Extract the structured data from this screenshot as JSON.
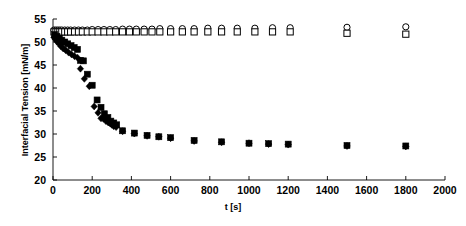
{
  "chart_data": {
    "type": "scatter",
    "title": "",
    "xlabel": "t [s]",
    "ylabel": "Interfacial Tension [mN/m]",
    "xlim": [
      0,
      2000
    ],
    "ylim": [
      20,
      55
    ],
    "xticks": [
      0,
      200,
      400,
      600,
      800,
      1000,
      1200,
      1400,
      1600,
      1800,
      2000
    ],
    "yticks": [
      20,
      25,
      30,
      35,
      40,
      45,
      50,
      55
    ],
    "grid": false,
    "legend": "none",
    "axis_color": "#000000",
    "marker_color": "#000000",
    "series": [
      {
        "name": "open-circle-series",
        "marker": "open-circle",
        "points": [
          [
            5,
            52.6
          ],
          [
            15,
            52.6
          ],
          [
            25,
            52.6
          ],
          [
            35,
            52.6
          ],
          [
            45,
            52.6
          ],
          [
            60,
            52.6
          ],
          [
            75,
            52.6
          ],
          [
            90,
            52.6
          ],
          [
            110,
            52.6
          ],
          [
            130,
            52.6
          ],
          [
            150,
            52.6
          ],
          [
            175,
            52.6
          ],
          [
            200,
            52.7
          ],
          [
            230,
            52.7
          ],
          [
            260,
            52.7
          ],
          [
            290,
            52.7
          ],
          [
            320,
            52.7
          ],
          [
            355,
            52.8
          ],
          [
            390,
            52.8
          ],
          [
            425,
            52.8
          ],
          [
            465,
            52.8
          ],
          [
            505,
            52.8
          ],
          [
            545,
            52.9
          ],
          [
            600,
            52.9
          ],
          [
            660,
            52.9
          ],
          [
            720,
            52.9
          ],
          [
            790,
            53.0
          ],
          [
            860,
            53.0
          ],
          [
            940,
            53.0
          ],
          [
            1030,
            53.0
          ],
          [
            1120,
            53.1
          ],
          [
            1210,
            53.1
          ],
          [
            1500,
            53.2
          ],
          [
            1800,
            53.3
          ]
        ]
      },
      {
        "name": "open-square-series",
        "marker": "open-square",
        "points": [
          [
            5,
            52.2
          ],
          [
            15,
            52.2
          ],
          [
            25,
            52.2
          ],
          [
            35,
            52.2
          ],
          [
            45,
            52.2
          ],
          [
            60,
            52.2
          ],
          [
            75,
            52.2
          ],
          [
            90,
            52.2
          ],
          [
            110,
            52.2
          ],
          [
            130,
            52.2
          ],
          [
            150,
            52.2
          ],
          [
            175,
            52.2
          ],
          [
            200,
            52.2
          ],
          [
            230,
            52.2
          ],
          [
            260,
            52.2
          ],
          [
            290,
            52.2
          ],
          [
            320,
            52.2
          ],
          [
            355,
            52.2
          ],
          [
            390,
            52.2
          ],
          [
            425,
            52.2
          ],
          [
            465,
            52.2
          ],
          [
            505,
            52.2
          ],
          [
            545,
            52.2
          ],
          [
            600,
            52.2
          ],
          [
            660,
            52.2
          ],
          [
            720,
            52.2
          ],
          [
            790,
            52.2
          ],
          [
            860,
            52.2
          ],
          [
            940,
            52.2
          ],
          [
            1030,
            52.2
          ],
          [
            1120,
            52.2
          ],
          [
            1210,
            52.2
          ],
          [
            1500,
            51.9
          ],
          [
            1800,
            51.7
          ]
        ]
      },
      {
        "name": "filled-diamond-series",
        "marker": "filled-diamond",
        "points": [
          [
            5,
            51.0
          ],
          [
            12,
            50.6
          ],
          [
            20,
            50.1
          ],
          [
            30,
            49.6
          ],
          [
            40,
            49.1
          ],
          [
            52,
            48.6
          ],
          [
            65,
            48.2
          ],
          [
            80,
            47.7
          ],
          [
            95,
            47.3
          ],
          [
            110,
            46.9
          ],
          [
            125,
            46.6
          ],
          [
            140,
            44.2
          ],
          [
            160,
            42.0
          ],
          [
            185,
            40.4
          ],
          [
            210,
            36.0
          ],
          [
            230,
            34.6
          ],
          [
            245,
            33.4
          ],
          [
            258,
            33.3
          ],
          [
            270,
            32.8
          ],
          [
            282,
            32.5
          ],
          [
            292,
            32.3
          ],
          [
            300,
            32.0
          ],
          [
            310,
            31.7
          ],
          [
            322,
            31.5
          ],
          [
            355,
            30.6
          ],
          [
            415,
            30.1
          ],
          [
            480,
            29.6
          ],
          [
            540,
            29.4
          ],
          [
            600,
            29.1
          ],
          [
            720,
            28.5
          ],
          [
            860,
            28.2
          ],
          [
            1000,
            28.0
          ],
          [
            1100,
            27.8
          ],
          [
            1200,
            27.7
          ],
          [
            1500,
            27.4
          ],
          [
            1800,
            27.3
          ]
        ]
      },
      {
        "name": "filled-square-series",
        "marker": "filled-square",
        "points": [
          [
            8,
            51.6
          ],
          [
            20,
            51.2
          ],
          [
            32,
            50.8
          ],
          [
            45,
            50.4
          ],
          [
            60,
            50.0
          ],
          [
            75,
            49.6
          ],
          [
            92,
            49.2
          ],
          [
            108,
            48.8
          ],
          [
            125,
            48.4
          ],
          [
            140,
            46.0
          ],
          [
            155,
            45.9
          ],
          [
            175,
            43.0
          ],
          [
            200,
            40.6
          ],
          [
            225,
            37.4
          ],
          [
            245,
            35.8
          ],
          [
            262,
            34.4
          ],
          [
            280,
            33.6
          ],
          [
            295,
            32.8
          ],
          [
            310,
            32.4
          ],
          [
            325,
            32.0
          ],
          [
            355,
            30.7
          ],
          [
            415,
            30.2
          ],
          [
            480,
            29.7
          ],
          [
            540,
            29.4
          ],
          [
            600,
            29.2
          ],
          [
            720,
            28.6
          ],
          [
            860,
            28.3
          ],
          [
            1000,
            28.0
          ],
          [
            1100,
            27.9
          ],
          [
            1200,
            27.8
          ],
          [
            1500,
            27.5
          ],
          [
            1800,
            27.4
          ]
        ]
      }
    ]
  }
}
